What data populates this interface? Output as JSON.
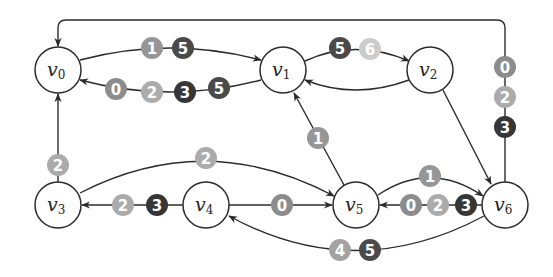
{
  "diagram": {
    "type": "directed-graph",
    "badge_colors": {
      "0": "#8c8c8c",
      "1": "#969696",
      "2": "#ababab",
      "3": "#363636",
      "4": "#a3a3a3",
      "5": "#4a4a4a",
      "6": "#cccccc"
    },
    "nodes": [
      {
        "id": "v0",
        "base": "v",
        "sub": "0",
        "x": 58,
        "y": 70
      },
      {
        "id": "v1",
        "base": "v",
        "sub": "1",
        "x": 283,
        "y": 70
      },
      {
        "id": "v2",
        "base": "v",
        "sub": "2",
        "x": 430,
        "y": 70
      },
      {
        "id": "v3",
        "base": "v",
        "sub": "3",
        "x": 58,
        "y": 205
      },
      {
        "id": "v4",
        "base": "v",
        "sub": "4",
        "x": 206,
        "y": 205
      },
      {
        "id": "v5",
        "base": "v",
        "sub": "5",
        "x": 356,
        "y": 205
      },
      {
        "id": "v6",
        "base": "v",
        "sub": "6",
        "x": 505,
        "y": 205
      }
    ],
    "edges": [
      {
        "from": "v0",
        "to": "v1",
        "labels": [
          "1",
          "5"
        ]
      },
      {
        "from": "v1",
        "to": "v0",
        "labels": [
          "0",
          "2",
          "3",
          "5"
        ]
      },
      {
        "from": "v1",
        "to": "v2",
        "labels": [
          "5",
          "6"
        ]
      },
      {
        "from": "v2",
        "to": "v1",
        "labels": []
      },
      {
        "from": "v2",
        "to": "v6",
        "labels": []
      },
      {
        "from": "v6",
        "to": "v0",
        "labels": [
          "0",
          "2",
          "3"
        ]
      },
      {
        "from": "v3",
        "to": "v0",
        "labels": [
          "2"
        ]
      },
      {
        "from": "v3",
        "to": "v5",
        "labels": [
          "2"
        ]
      },
      {
        "from": "v4",
        "to": "v3",
        "labels": [
          "2",
          "3"
        ]
      },
      {
        "from": "v4",
        "to": "v5",
        "labels": [
          "0"
        ]
      },
      {
        "from": "v5",
        "to": "v1",
        "labels": [
          "1"
        ]
      },
      {
        "from": "v5",
        "to": "v6",
        "labels": [
          "1"
        ]
      },
      {
        "from": "v6",
        "to": "v5",
        "labels": [
          "0",
          "2",
          "3"
        ]
      },
      {
        "from": "v6",
        "to": "v4",
        "labels": [
          "4",
          "5"
        ]
      }
    ]
  },
  "badges": {
    "e01": [
      "1",
      "5"
    ],
    "e10": [
      "0",
      "2",
      "3",
      "5"
    ],
    "e12": [
      "5",
      "6"
    ],
    "e60": [
      "0",
      "2",
      "3"
    ],
    "e30": [
      "2"
    ],
    "e35": [
      "2"
    ],
    "e43": [
      "2",
      "3"
    ],
    "e45": [
      "0"
    ],
    "e51": [
      "1"
    ],
    "e56": [
      "1"
    ],
    "e65": [
      "0",
      "2",
      "3"
    ],
    "e64": [
      "4",
      "5"
    ]
  },
  "labels": {
    "v0": {
      "base": "v",
      "sub": "0"
    },
    "v1": {
      "base": "v",
      "sub": "1"
    },
    "v2": {
      "base": "v",
      "sub": "2"
    },
    "v3": {
      "base": "v",
      "sub": "3"
    },
    "v4": {
      "base": "v",
      "sub": "4"
    },
    "v5": {
      "base": "v",
      "sub": "5"
    },
    "v6": {
      "base": "v",
      "sub": "6"
    }
  }
}
